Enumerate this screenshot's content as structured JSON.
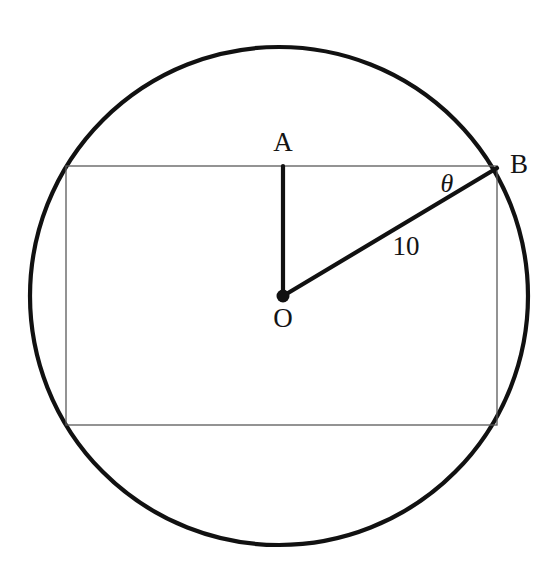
{
  "figure": {
    "background_color": "#ffffff",
    "stroke_color": "#111111",
    "thin_stroke_color": "#555555",
    "canvas": {
      "width": 558,
      "height": 574
    }
  },
  "circle": {
    "center_x": 279,
    "center_y": 296,
    "radius": 249,
    "stroke_width": 4.2,
    "fill": "none",
    "color": "#111111"
  },
  "rectangle": {
    "left": 66,
    "top": 166,
    "right": 497,
    "bottom": 425,
    "width": 431,
    "height": 259,
    "stroke_width": 1.3,
    "color": "#5a5a5a",
    "fill": "none"
  },
  "points": {
    "O": {
      "x": 283,
      "y": 296,
      "dot_radius": 6.5,
      "label": "O",
      "label_x": 283,
      "label_y": 321
    },
    "A": {
      "x": 283,
      "y": 166,
      "label": "A",
      "label_x": 283,
      "label_y": 145
    },
    "B": {
      "x": 497,
      "y": 168,
      "label": "B",
      "label_x": 519,
      "label_y": 167
    }
  },
  "segments": {
    "OA": {
      "x1": 283,
      "y1": 296,
      "x2": 283,
      "y2": 166,
      "stroke_width": 4.2,
      "color": "#111111"
    },
    "OB": {
      "x1": 283,
      "y1": 296,
      "x2": 497,
      "y2": 168,
      "stroke_width": 4.2,
      "color": "#111111"
    }
  },
  "annotations": {
    "radius_length": {
      "text": "10",
      "x": 406,
      "y": 249
    },
    "angle": {
      "text": "θ",
      "x": 447,
      "y": 186
    }
  },
  "chart_data": {
    "type": "diagram",
    "elements": [
      {
        "name": "circle",
        "role": "circumscribing-circle",
        "radius": 10,
        "units": "unitless"
      },
      {
        "name": "rectangle",
        "role": "inscribed-rectangle"
      },
      {
        "name": "O",
        "role": "circle-center"
      },
      {
        "name": "A",
        "role": "midpoint-of-top-side"
      },
      {
        "name": "B",
        "role": "top-right-vertex-on-circle"
      },
      {
        "name": "OA",
        "role": "apothem-to-top-side",
        "description": "vertical segment from center to top side"
      },
      {
        "name": "OB",
        "role": "radius-to-vertex",
        "length_label": "10"
      },
      {
        "name": "theta",
        "role": "angle-at-B-between-top-side-and-OB",
        "symbol": "θ"
      }
    ],
    "labels": [
      "A",
      "B",
      "O",
      "10",
      "θ"
    ]
  }
}
